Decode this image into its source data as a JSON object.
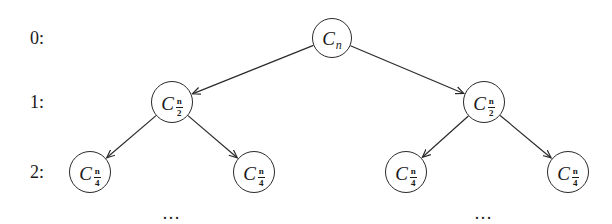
{
  "diagram": {
    "type": "binary-recursion-tree",
    "levels": [
      {
        "label": "0:",
        "y": 38
      },
      {
        "label": "1:",
        "y": 102
      },
      {
        "label": "2:",
        "y": 172
      }
    ],
    "nodes": [
      {
        "id": "root",
        "base": "C",
        "sub": "n",
        "frac": null,
        "cx": 332,
        "cy": 38,
        "r": 20
      },
      {
        "id": "l1a",
        "base": "C",
        "sub": null,
        "frac": {
          "num": "n",
          "den": "2"
        },
        "cx": 172,
        "cy": 102,
        "r": 21
      },
      {
        "id": "l1b",
        "base": "C",
        "sub": null,
        "frac": {
          "num": "n",
          "den": "2"
        },
        "cx": 484,
        "cy": 102,
        "r": 21
      },
      {
        "id": "l2a",
        "base": "C",
        "sub": null,
        "frac": {
          "num": "n",
          "den": "4"
        },
        "cx": 90,
        "cy": 172,
        "r": 21
      },
      {
        "id": "l2b",
        "base": "C",
        "sub": null,
        "frac": {
          "num": "n",
          "den": "4"
        },
        "cx": 254,
        "cy": 172,
        "r": 21
      },
      {
        "id": "l2c",
        "base": "C",
        "sub": null,
        "frac": {
          "num": "n",
          "den": "4"
        },
        "cx": 406,
        "cy": 172,
        "r": 21
      },
      {
        "id": "l2d",
        "base": "C",
        "sub": null,
        "frac": {
          "num": "n",
          "den": "4"
        },
        "cx": 568,
        "cy": 172,
        "r": 21
      }
    ],
    "edges": [
      {
        "from": "root",
        "to": "l1a"
      },
      {
        "from": "root",
        "to": "l1b"
      },
      {
        "from": "l1a",
        "to": "l2a"
      },
      {
        "from": "l1a",
        "to": "l2b"
      },
      {
        "from": "l1b",
        "to": "l2c"
      },
      {
        "from": "l1b",
        "to": "l2d"
      }
    ],
    "ellipses": [
      {
        "text": "…",
        "x": 172,
        "y": 214
      },
      {
        "text": "…",
        "x": 484,
        "y": 214
      }
    ],
    "colors": {
      "stroke": "#2a2a2a",
      "text": "#1a1a1a",
      "background": "#ffffff"
    }
  }
}
